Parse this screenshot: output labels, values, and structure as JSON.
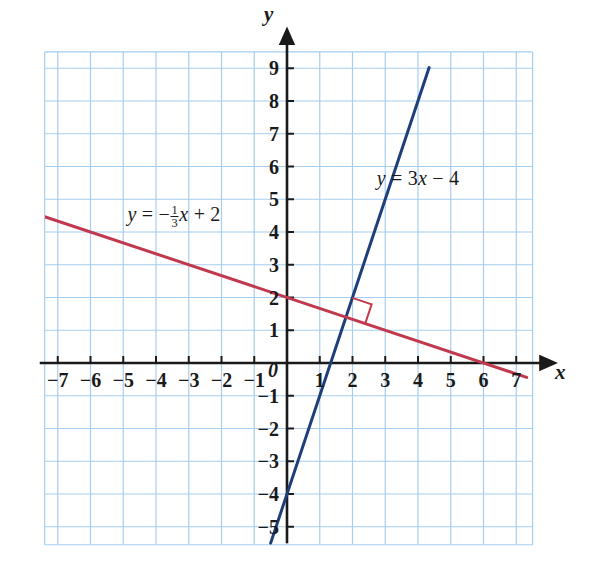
{
  "chart_data": {
    "type": "line",
    "title": "",
    "xlabel": "x",
    "ylabel": "y",
    "xlim": [
      -7.6,
      7.6
    ],
    "ylim": [
      -5.6,
      9.6
    ],
    "grid": true,
    "grid_step": 1,
    "grid_color": "#a8cdee",
    "axis_color": "#1a1a1a",
    "legend": "inline-labels",
    "origin_label": "0",
    "xticks": [
      -7,
      -6,
      -5,
      -4,
      -3,
      -2,
      -1,
      1,
      2,
      3,
      4,
      5,
      6,
      7
    ],
    "xtick_labels": [
      "−7",
      "−6",
      "−5",
      "−4",
      "−3",
      "−2",
      "−1",
      "1",
      "2",
      "3",
      "4",
      "5",
      "6",
      "7"
    ],
    "yticks": [
      9,
      8,
      7,
      6,
      5,
      4,
      3,
      2,
      1,
      -1,
      -2,
      -3,
      -4,
      -5
    ],
    "ytick_labels": [
      "9",
      "8",
      "7",
      "6",
      "5",
      "4",
      "3",
      "2",
      "1",
      "−1",
      "−2",
      "−3",
      "−4",
      "−5"
    ],
    "series": [
      {
        "name": "y = 3x − 4",
        "color": "#1f3f7a",
        "slope": 3,
        "intercept": -4,
        "x": [
          -0.5,
          4.34
        ],
        "values": [
          -5.5,
          9.02
        ],
        "label_text_parts": {
          "lhs": "y",
          "equals": "=",
          "coefficient": "3",
          "variable": "x",
          "operator": "−",
          "constant": "4"
        },
        "label_x": 4.0,
        "label_y": 5.6
      },
      {
        "name": "y = −⅓x + 2",
        "color": "#c0394f",
        "slope": -0.3333333,
        "intercept": 2,
        "x": [
          -7.4,
          7.32
        ],
        "values": [
          4.467,
          -0.44
        ],
        "label_text_parts": {
          "lhs": "y",
          "equals": "=",
          "sign": "−",
          "fraction_numerator": "1",
          "fraction_denominator": "3",
          "variable": "x",
          "operator": "+",
          "constant": "2"
        },
        "label_x": -3.45,
        "label_y": 4.5
      }
    ],
    "annotations": [
      {
        "name": "right-angle-marker",
        "type": "square",
        "color": "#c0394f",
        "at_x": 1.8,
        "at_y": 1.4,
        "size": 0.62,
        "note": "perpendicular lines"
      }
    ],
    "intersection": {
      "x": 1.8,
      "y": 1.4
    },
    "x_intercepts": {
      "blue": 1.333,
      "red": 6
    },
    "y_intercepts": {
      "blue": -4,
      "red": 2
    }
  },
  "axes": {
    "x_name": "x",
    "y_name": "y"
  }
}
